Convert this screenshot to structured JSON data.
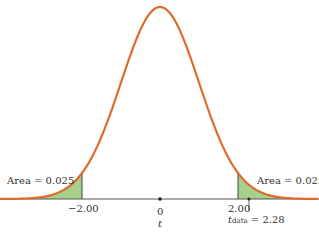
{
  "chart_data": {
    "type": "area",
    "title": "",
    "xlabel": "t",
    "ylabel": "",
    "distribution": "t density curve",
    "x_ticks": [
      "-2.00",
      "0",
      "2.00"
    ],
    "critical_values": [
      -2.0,
      2.0
    ],
    "observed": {
      "label": "t",
      "subscript": "data",
      "value": 2.28,
      "text": "= 2.28"
    },
    "shaded_regions": [
      {
        "side": "left",
        "from": null,
        "to": -2.0,
        "area": 0.025,
        "label": "Area = 0.025"
      },
      {
        "side": "right",
        "from": 2.0,
        "to": null,
        "area": 0.025,
        "label": "Area = 0.025"
      }
    ],
    "colors": {
      "curve": "#e06a2c",
      "fill": "#a8d08d",
      "axis": "#555555"
    },
    "grid": false,
    "legend": null
  },
  "labels": {
    "left_area": "Area = 0.025",
    "right_area": "Area = 0.025",
    "tick_neg": "−2.00",
    "tick_zero": "0",
    "tick_pos": "2.00",
    "axis_var": "t",
    "tdata_main": "t",
    "tdata_sub": "data",
    "tdata_value": " = 2.28"
  }
}
